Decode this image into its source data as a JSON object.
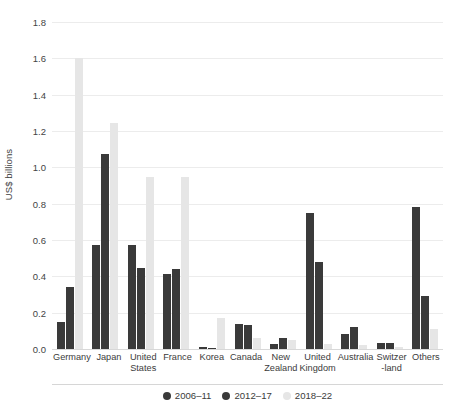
{
  "chart_data": {
    "type": "bar",
    "title": "",
    "subtitle": "",
    "xlabel": "",
    "ylabel": "US$ billions",
    "ylim": [
      0,
      1.8
    ],
    "yticks": [
      "0.0",
      "0.2",
      "0.4",
      "0.6",
      "0.8",
      "1.0",
      "1.2",
      "1.4",
      "1.6",
      "1.8"
    ],
    "ytick_values": [
      0.0,
      0.2,
      0.4,
      0.6,
      0.8,
      1.0,
      1.2,
      1.4,
      1.6,
      1.8
    ],
    "grid": true,
    "legend_position": "bottom",
    "categories": [
      "Germany",
      "Japan",
      "United States",
      "France",
      "Korea",
      "Canada",
      "New Zealand",
      "United Kingdom",
      "Australia",
      "Switzer -land",
      "Others"
    ],
    "category_lines": [
      [
        "Germany"
      ],
      [
        "Japan"
      ],
      [
        "United",
        "States"
      ],
      [
        "France"
      ],
      [
        "Korea"
      ],
      [
        "Canada"
      ],
      [
        "New",
        "Zealand"
      ],
      [
        "United",
        "Kingdom"
      ],
      [
        "Australia"
      ],
      [
        "Switzer",
        "-land"
      ],
      [
        "Others"
      ]
    ],
    "series": [
      {
        "name": "2006–11",
        "color": "#3a3a3a",
        "values": [
          0.15,
          0.575,
          0.575,
          0.415,
          0.01,
          0.135,
          0.03,
          0.75,
          0.08,
          0.035,
          0.78
        ]
      },
      {
        "name": "2012–17",
        "color": "#3a3a3a",
        "values": [
          0.34,
          1.075,
          0.445,
          0.44,
          0.005,
          0.13,
          0.06,
          0.48,
          0.12,
          0.035,
          0.29
        ]
      },
      {
        "name": "2018–22",
        "color": "#e6e6e6",
        "values": [
          1.6,
          1.245,
          0.945,
          0.945,
          0.17,
          0.06,
          0.05,
          0.025,
          0.02,
          0.012,
          0.11
        ]
      }
    ]
  }
}
